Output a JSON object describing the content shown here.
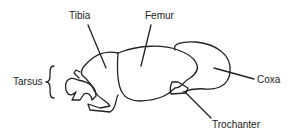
{
  "diagram": {
    "labels": {
      "tibia": "Tibia",
      "femur": "Femur",
      "tarsus": "Tarsus",
      "coxa": "Coxa",
      "trochanter": "Trochanter"
    },
    "colors": {
      "stroke": "#222222",
      "background": "#ffffff"
    }
  }
}
